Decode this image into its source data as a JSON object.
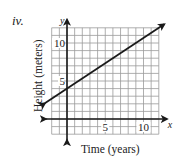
{
  "problem": {
    "label": "iv."
  },
  "chart_data": {
    "type": "line",
    "title": "",
    "xlabel": "Time (years)",
    "ylabel": "Height (meters)",
    "x_axis_name": "x",
    "y_axis_name": "y",
    "xlim": [
      -2,
      12
    ],
    "ylim": [
      -2,
      12
    ],
    "grid": true,
    "x_ticks": [
      {
        "value": 5,
        "label": "5"
      },
      {
        "value": 10,
        "label": "10"
      }
    ],
    "y_ticks": [
      {
        "value": 5,
        "label": "5"
      },
      {
        "value": 10,
        "label": "10"
      }
    ],
    "series": [
      {
        "name": "height",
        "equation": "y = (2/3)x + 4",
        "slope": 0.6667,
        "intercept": 4,
        "x": [
          -2,
          0,
          3,
          6,
          9,
          12
        ],
        "values": [
          2.67,
          4,
          6,
          8,
          10,
          12
        ],
        "arrows_both_ends": true
      }
    ],
    "colors": {
      "line": "#1a1a1a",
      "grid": "#9a9a9a",
      "axes": "#1a1a1a"
    }
  }
}
